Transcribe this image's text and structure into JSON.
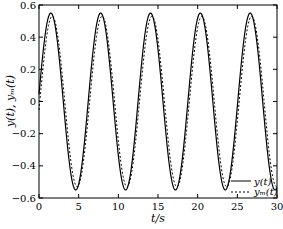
{
  "chart_data": {
    "type": "line",
    "title": "",
    "xlabel": "t/s",
    "ylabel": "y(t), y_m(t)",
    "xlim": [
      0,
      30
    ],
    "ylim": [
      -0.6,
      0.6
    ],
    "xticks": [
      0,
      5,
      10,
      15,
      20,
      25,
      30
    ],
    "yticks": [
      -0.6,
      -0.4,
      -0.2,
      0,
      0.2,
      0.4,
      0.6
    ],
    "xtick_labels": [
      "0",
      "5",
      "10",
      "15",
      "20",
      "25",
      "30"
    ],
    "ytick_labels": [
      "−0.6",
      "−0.4",
      "−0.2",
      "0",
      "0.2",
      "0.4",
      "0.6"
    ],
    "grid": false,
    "legend_position": "lower right",
    "series": [
      {
        "name": "y(t)",
        "style": "solid",
        "color": "#000000",
        "description": "sinusoid, amplitude ~0.55, period ~6.28 s (omega = 1 rad/s)",
        "amplitude": 0.55,
        "omega": 1.0,
        "phase": 0.08,
        "peaks_t": [
          1.5,
          7.8,
          14.1,
          20.4,
          26.7
        ],
        "troughs_t": [
          4.7,
          11.0,
          17.3,
          23.5
        ],
        "x": [
          0,
          1.57,
          3.14,
          4.71,
          6.28,
          7.85,
          9.42,
          11.0,
          12.57,
          14.14,
          15.71,
          17.28,
          18.85,
          20.42,
          21.99,
          23.56,
          25.13,
          26.7,
          28.27,
          30
        ],
        "values": [
          0.05,
          0.55,
          0.0,
          -0.55,
          0.0,
          0.55,
          0.0,
          -0.55,
          0.0,
          0.55,
          0.0,
          -0.55,
          0.0,
          0.55,
          0.0,
          -0.55,
          0.0,
          0.55,
          0.0,
          -0.54
        ]
      },
      {
        "name": "y_m(t)",
        "style": "dashed",
        "color": "#000000",
        "description": "reference model output, amplitude ~0.53, slightly lagging y(t)",
        "amplitude": 0.53,
        "omega": 1.0,
        "phase": -0.1,
        "x": [
          0,
          1.57,
          3.14,
          4.71,
          6.28,
          7.85,
          9.42,
          11.0,
          12.57,
          14.14,
          15.71,
          17.28,
          18.85,
          20.42,
          21.99,
          23.56,
          25.13,
          26.7,
          28.27,
          30
        ],
        "values": [
          -0.05,
          0.53,
          0.05,
          -0.53,
          -0.05,
          0.53,
          0.05,
          -0.53,
          -0.05,
          0.53,
          0.05,
          -0.53,
          -0.05,
          0.53,
          0.05,
          -0.53,
          -0.05,
          0.53,
          0.05,
          -0.52
        ]
      }
    ]
  },
  "legend": {
    "items": [
      {
        "label": "y(t)",
        "style": "solid"
      },
      {
        "label": "yₘ(t)",
        "style": "dashed"
      }
    ]
  },
  "axes": {
    "xlabel": "t/s",
    "ylabel": "y(t), yₘ(t)"
  }
}
